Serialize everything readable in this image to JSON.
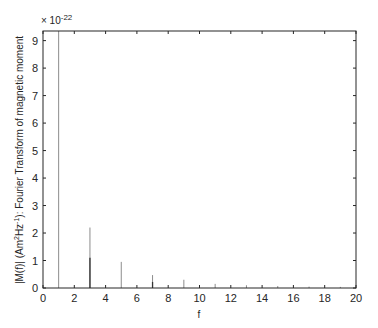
{
  "chart_data": {
    "type": "stem",
    "title": "",
    "xlabel": "f",
    "ylabel": "|M(f)| (Am²Hz⁻¹): Fourier Transform of magnetic moment",
    "ylabel_parts": {
      "pre": "|M(f)| (Am",
      "sup1": "2",
      "mid": "Hz",
      "sup2": "-1",
      "post": "): Fourier Transform of magnetic moment"
    },
    "y_exponent_label": "× 10",
    "y_exponent_power": "-22",
    "xlim": [
      0,
      20
    ],
    "ylim": [
      0,
      9.35
    ],
    "xticks": [
      0,
      2,
      4,
      6,
      8,
      10,
      12,
      14,
      16,
      18,
      20
    ],
    "yticks": [
      0,
      1,
      2,
      3,
      4,
      5,
      6,
      7,
      8,
      9
    ],
    "grid": false,
    "series": [
      {
        "name": "light component",
        "color": "#8c8c8c",
        "x": [
          1,
          3,
          5,
          7,
          9,
          11,
          13,
          15,
          17,
          19
        ],
        "values": [
          9.35,
          2.2,
          0.95,
          0.47,
          0.3,
          0.15,
          0.1,
          0.07,
          0.05,
          0.04
        ]
      },
      {
        "name": "dark component",
        "color": "#333333",
        "x": [
          3,
          7
        ],
        "values": [
          1.1,
          0.22
        ]
      }
    ]
  }
}
